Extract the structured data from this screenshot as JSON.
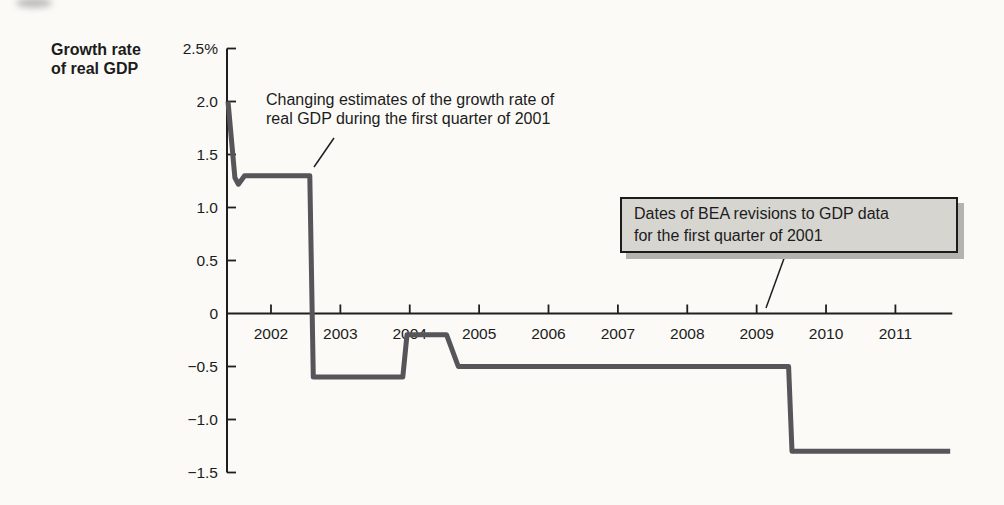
{
  "figure": {
    "colors": {
      "background": "#fbfaf7",
      "axis": "#1e1e1e",
      "text": "#1c1c1c",
      "curve": "#55555a",
      "callout_fill": "#d7d5d0",
      "callout_border": "#1c1c1c",
      "callout_shadow": "#b5b3ad"
    }
  },
  "chart_data": {
    "type": "line",
    "title": "",
    "xlabel": "",
    "ylabel": "Growth rate of real GDP",
    "ylabel_lines": [
      "Growth rate",
      "of real GDP"
    ],
    "grid": false,
    "legend": "none",
    "xlim": [
      2001.366,
      2011.82
    ],
    "ylim": [
      -1.5,
      2.5
    ],
    "x_ticks": [
      2002,
      2003,
      2004,
      2005,
      2006,
      2007,
      2008,
      2009,
      2010,
      2011
    ],
    "y_ticks": [
      {
        "value": 2.5,
        "label": "2.5%"
      },
      {
        "value": 2.0,
        "label": "2.0"
      },
      {
        "value": 1.5,
        "label": "1.5"
      },
      {
        "value": 1.0,
        "label": "1.0"
      },
      {
        "value": 0.5,
        "label": "0.5"
      },
      {
        "value": 0,
        "label": "0"
      },
      {
        "value": -0.5,
        "label": "−0.5"
      },
      {
        "value": -1.0,
        "label": "−1.0"
      },
      {
        "value": -1.5,
        "label": "−1.5"
      }
    ],
    "series": [
      {
        "name": "Estimated growth rate of real GDP for 2001 Q1",
        "points": [
          [
            2001.38,
            2.0
          ],
          [
            2001.48,
            1.28
          ],
          [
            2001.53,
            1.22
          ],
          [
            2001.62,
            1.3
          ],
          [
            2002.56,
            1.3
          ],
          [
            2002.61,
            -0.6
          ],
          [
            2003.9,
            -0.6
          ],
          [
            2003.96,
            -0.2
          ],
          [
            2004.53,
            -0.2
          ],
          [
            2004.7,
            -0.5
          ],
          [
            2009.46,
            -0.5
          ],
          [
            2009.51,
            -1.3
          ],
          [
            2011.79,
            -1.3
          ]
        ]
      }
    ],
    "annotations": [
      {
        "id": "estimates-note",
        "boxed": false,
        "lines": [
          "Changing estimates of the growth rate of",
          "real GDP during the first quarter of 2001"
        ],
        "leader_px": [
          334,
          138,
          314,
          167
        ]
      },
      {
        "id": "bea-revisions-note",
        "boxed": true,
        "lines": [
          "Dates of BEA revisions to GDP data",
          "for the first quarter of 2001"
        ],
        "leader_px": [
          786,
          253,
          766,
          308
        ]
      }
    ]
  }
}
